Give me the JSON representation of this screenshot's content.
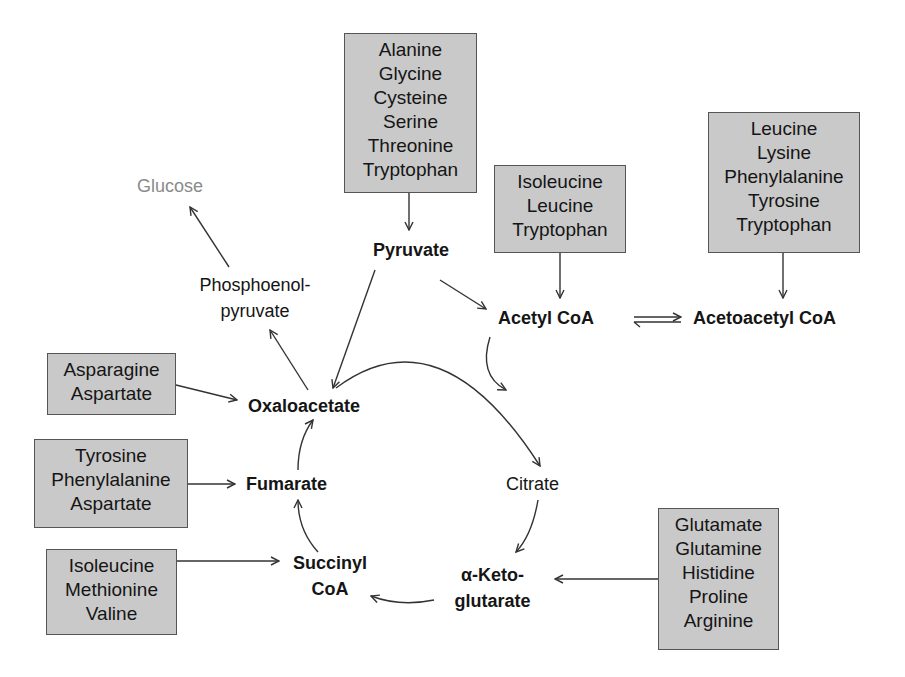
{
  "colors": {
    "box_fill": "#c9c9c9",
    "box_border": "#555555",
    "text": "#151515",
    "glucose_text": "#8a8a8a",
    "arrow": "#333333"
  },
  "boxes": {
    "pyruvate_sources": [
      "Alanine",
      "Glycine",
      "Cysteine",
      "Serine",
      "Threonine",
      "Tryptophan"
    ],
    "acetyl_coa_sources": [
      "Isoleucine",
      "Leucine",
      "Tryptophan"
    ],
    "acetoacetyl_coa_sources": [
      "Leucine",
      "Lysine",
      "Phenylalanine",
      "Tyrosine",
      "Tryptophan"
    ],
    "oxaloacetate_sources": [
      "Asparagine",
      "Aspartate"
    ],
    "fumarate_sources": [
      "Tyrosine",
      "Phenylalanine",
      "Aspartate"
    ],
    "succinyl_coa_sources": [
      "Isoleucine",
      "Methionine",
      "Valine"
    ],
    "alpha_ketoglutarate_sources": [
      "Glutamate",
      "Glutamine",
      "Histidine",
      "Proline",
      "Arginine"
    ]
  },
  "metabolites": {
    "glucose": "Glucose",
    "pep_line1": "Phosphoenol-",
    "pep_line2": "pyruvate",
    "pyruvate": "Pyruvate",
    "acetyl_coa": "Acetyl CoA",
    "acetoacetyl_coa": "Acetoacetyl CoA",
    "oxaloacetate": "Oxaloacetate",
    "citrate": "Citrate",
    "fumarate": "Fumarate",
    "succinyl_line1": "Succinyl",
    "succinyl_line2": "CoA",
    "akg_line1": "α-Keto-",
    "akg_line2": "glutarate"
  }
}
